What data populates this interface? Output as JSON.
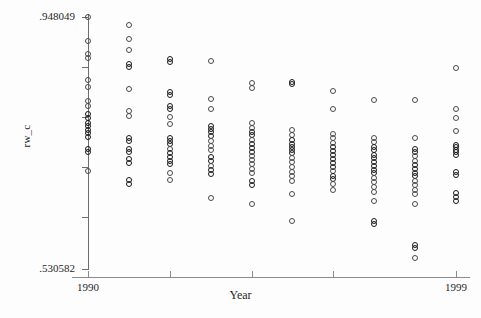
{
  "chart_data": {
    "type": "scatter",
    "title": "",
    "xlabel": "Year",
    "ylabel": "rw_c",
    "xlim": [
      1990,
      1999
    ],
    "ylim": [
      0.530582,
      0.948049
    ],
    "grid": false,
    "legend": null,
    "y_tick_labels": [
      "0.948049",
      "0.530582"
    ],
    "y_axis_min_label": ".530582",
    "y_axis_max_label": ".948049",
    "x_tick_labels": [
      "1990",
      "1999"
    ],
    "x_tick_values": [
      1990,
      1992,
      1994,
      1996,
      1999
    ],
    "y_tick_values": [
      0.948049,
      0.865,
      0.782,
      0.699,
      0.616,
      0.530582
    ],
    "marker": "open-circle",
    "marker_color": "#4a4a4a",
    "series": [
      {
        "name": "rw_c",
        "points_by_year": [
          {
            "x": 1990,
            "y": [
              0.948,
              0.909,
              0.887,
              0.88,
              0.844,
              0.832,
              0.809,
              0.8,
              0.787,
              0.781,
              0.773,
              0.767,
              0.761,
              0.756,
              0.75,
              0.73,
              0.724,
              0.693
            ]
          },
          {
            "x": 1991,
            "y": [
              0.935,
              0.912,
              0.893,
              0.87,
              0.866,
              0.828,
              0.793,
              0.784,
              0.748,
              0.742,
              0.73,
              0.725,
              0.712,
              0.706,
              0.678,
              0.672
            ]
          },
          {
            "x": 1992,
            "y": [
              0.879,
              0.874,
              0.824,
              0.819,
              0.801,
              0.796,
              0.783,
              0.77,
              0.748,
              0.742,
              0.738,
              0.73,
              0.722,
              0.716,
              0.71,
              0.704,
              0.69,
              0.678
            ]
          },
          {
            "x": 1993,
            "y": [
              0.875,
              0.813,
              0.796,
              0.767,
              0.762,
              0.757,
              0.751,
              0.742,
              0.734,
              0.727,
              0.716,
              0.71,
              0.701,
              0.694,
              0.688,
              0.648
            ]
          },
          {
            "x": 1994,
            "y": [
              0.839,
              0.831,
              0.772,
              0.764,
              0.757,
              0.752,
              0.745,
              0.737,
              0.731,
              0.725,
              0.718,
              0.711,
              0.704,
              0.696,
              0.689,
              0.676,
              0.67,
              0.639
            ]
          },
          {
            "x": 1995,
            "y": [
              0.84,
              0.837,
              0.761,
              0.753,
              0.744,
              0.738,
              0.733,
              0.728,
              0.723,
              0.715,
              0.708,
              0.7,
              0.691,
              0.684,
              0.676,
              0.654,
              0.61
            ]
          },
          {
            "x": 1996,
            "y": [
              0.826,
              0.796,
              0.754,
              0.747,
              0.74,
              0.732,
              0.726,
              0.719,
              0.713,
              0.706,
              0.7,
              0.693,
              0.685,
              0.679,
              0.671,
              0.661
            ]
          },
          {
            "x": 1997,
            "y": [
              0.811,
              0.748,
              0.741,
              0.733,
              0.727,
              0.72,
              0.714,
              0.708,
              0.701,
              0.695,
              0.689,
              0.682,
              0.674,
              0.666,
              0.658,
              0.643,
              0.61,
              0.605
            ]
          },
          {
            "x": 1998,
            "y": [
              0.811,
              0.747,
              0.73,
              0.724,
              0.717,
              0.71,
              0.703,
              0.697,
              0.69,
              0.684,
              0.677,
              0.67,
              0.662,
              0.654,
              0.638,
              0.571,
              0.566,
              0.549
            ]
          },
          {
            "x": 1999,
            "y": [
              0.863,
              0.795,
              0.78,
              0.76,
              0.736,
              0.732,
              0.728,
              0.724,
              0.72,
              0.692,
              0.686,
              0.656,
              0.65,
              0.644
            ]
          }
        ]
      }
    ]
  },
  "axes": {
    "y_label_top": ".948049",
    "y_label_bottom": ".530582",
    "y_title": "rw_c",
    "x_label_left": "1990",
    "x_label_right": "1999",
    "x_title": "Year"
  }
}
